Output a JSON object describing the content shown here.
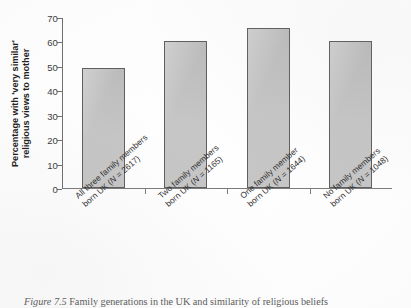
{
  "chart_data": {
    "type": "bar",
    "title": "",
    "xlabel": "",
    "ylabel": "Percentage with 'very similar' religious views to mother",
    "ylabel_line1": "Percentage with 'very similar'",
    "ylabel_line2": "religious views to mother",
    "categories": [
      "All three family members born UK (N = 2617)",
      "Two family members born UK (N = 1165)",
      "One family member born UK (N = 1644)",
      "No family members born UK (N = 1048)"
    ],
    "category_lines": [
      [
        "All three family members",
        "born UK (N = 2617)"
      ],
      [
        "Two family members",
        "born UK (N = 1165)"
      ],
      [
        "One family member",
        "born UK (N = 1644)"
      ],
      [
        "No family members",
        "born UK (N = 1048)"
      ]
    ],
    "category_counts": [
      2617,
      1165,
      1644,
      1048
    ],
    "values": [
      49,
      60.2,
      65.5,
      60.2
    ],
    "ylim": [
      0,
      70
    ],
    "ytick_values": [
      70,
      60,
      50,
      40,
      30,
      20,
      10,
      0
    ],
    "ytick_labels": [
      "70",
      "60",
      "50",
      "40",
      "30",
      "20",
      "10",
      "0"
    ],
    "ytick_step": 10,
    "grid": false,
    "legend": false,
    "bar_fill_color": "#c6c6c6",
    "bar_border_color": "#5e5e5e",
    "axis_color": "#6f6f6f"
  },
  "caption": {
    "prefix": "Figure 7.5",
    "text": "Family generations in the UK and similarity of religious beliefs"
  }
}
